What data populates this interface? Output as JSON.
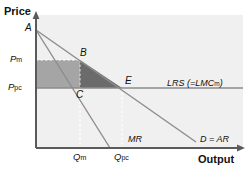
{
  "figure": {
    "type": "economics-diagram",
    "axes": {
      "y_label": "Price",
      "x_label": "Output",
      "origin": [
        36,
        148
      ]
    },
    "price_ticks": [
      {
        "id": "pm",
        "base": "P",
        "sub": "m",
        "y": 60
      },
      {
        "id": "ppc",
        "base": "P",
        "sub": "pc",
        "y": 88
      }
    ],
    "quantity_ticks": [
      {
        "id": "qm",
        "base": "Q",
        "sub": "m",
        "x": 80
      },
      {
        "id": "qpc",
        "base": "Q",
        "sub": "pc",
        "x": 122
      }
    ],
    "points": [
      {
        "label": "A",
        "x": 36,
        "y": 30
      },
      {
        "label": "B",
        "x": 80,
        "y": 60
      },
      {
        "label": "C",
        "x": 80,
        "y": 88
      },
      {
        "label": "E",
        "x": 122,
        "y": 88
      }
    ],
    "curves": [
      {
        "id": "demand",
        "label": "D = AR",
        "from": [
          36,
          30
        ],
        "to": [
          196,
          142
        ]
      },
      {
        "id": "mr",
        "label": "MR",
        "from": [
          36,
          30
        ],
        "to": [
          110,
          148
        ]
      },
      {
        "id": "lrs",
        "label_base": "LRS (=LMC",
        "label_sub": "m",
        "label_close": ")",
        "y": 88,
        "from_x": 36,
        "to_x": 243
      }
    ],
    "regions": [
      {
        "id": "producer-surplus-rect",
        "shape": "rect",
        "color": "#a3a3a3"
      },
      {
        "id": "deadweight-loss",
        "shape": "triangle",
        "color": "#6f6f6f"
      }
    ],
    "colors": {
      "plot_background": "#f0f0f0",
      "line": "#8c8c8c",
      "axis": "#595959",
      "rect_fill": "#a5a5a5",
      "triangle_fill": "#6b6b6b",
      "dashed": "#ffffff",
      "text": "#111111"
    }
  }
}
